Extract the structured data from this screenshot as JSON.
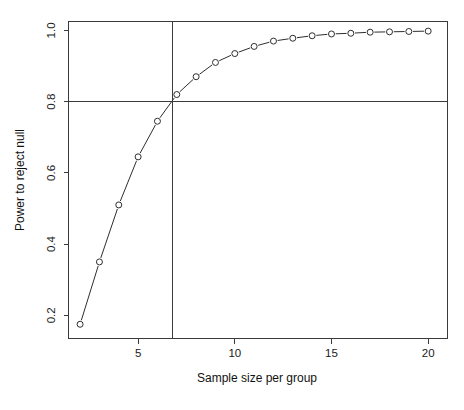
{
  "chart_data": {
    "type": "line",
    "title": "",
    "subtitle": "",
    "xlabel": "Sample size per group",
    "ylabel": "Power to reject null",
    "x": [
      2,
      3,
      4,
      5,
      6,
      7,
      8,
      9,
      10,
      11,
      12,
      13,
      14,
      15,
      16,
      17,
      18,
      19,
      20
    ],
    "values": [
      0.175,
      0.35,
      0.51,
      0.645,
      0.745,
      0.82,
      0.87,
      0.91,
      0.935,
      0.955,
      0.97,
      0.978,
      0.985,
      0.99,
      0.992,
      0.995,
      0.996,
      0.997,
      0.998
    ],
    "series": [
      {
        "name": "power",
        "values": [
          0.175,
          0.35,
          0.51,
          0.645,
          0.745,
          0.82,
          0.87,
          0.91,
          0.935,
          0.955,
          0.97,
          0.978,
          0.985,
          0.99,
          0.992,
          0.995,
          0.996,
          0.997,
          0.998
        ]
      }
    ],
    "xlim": [
      1.4,
      21.0
    ],
    "ylim": [
      0.135,
      1.025
    ],
    "xticks": [
      5,
      10,
      15,
      20
    ],
    "xtick_labels": [
      "5",
      "10",
      "15",
      "20"
    ],
    "yticks": [
      0.2,
      0.4,
      0.6,
      0.8,
      1.0
    ],
    "ytick_labels": [
      "0.2",
      "0.4",
      "0.6",
      "0.8",
      "1.0"
    ],
    "grid": false,
    "legend": "none",
    "marker": "open-circle",
    "line_style": "solid",
    "reference_lines": [
      {
        "orientation": "horizontal",
        "value": 0.8,
        "name": "target-power-line"
      },
      {
        "orientation": "vertical",
        "value": 6.8,
        "name": "required-n-line"
      }
    ],
    "colors": {
      "line": "#2e2e2e",
      "marker_fill": "#ffffff",
      "marker_stroke": "#2e2e2e",
      "axis": "#3a3a3a",
      "reference": "#3b3b3b",
      "background": "#ffffff"
    }
  }
}
